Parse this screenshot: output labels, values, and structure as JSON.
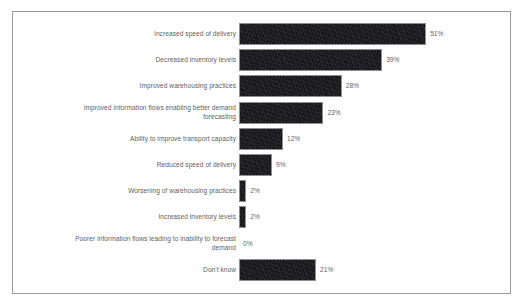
{
  "chart_data": {
    "type": "bar",
    "orientation": "horizontal",
    "title": "",
    "subtitle": "",
    "xlabel": "",
    "ylabel": "",
    "grid": false,
    "legend": null,
    "xlim": [
      0,
      51
    ],
    "value_suffix": "%",
    "categories": [
      "Increased speed of delivery",
      "Decreased inventory levels",
      "Improved warehousing practices",
      "Improved information flows enabling better demand\nforecasting",
      "Ability to improve transport capacity",
      "Reduced speed of delivery",
      "Worsening of warehousing practices",
      "Increased inventory levels",
      "Poorer information flows leading to inability to forecast\ndemand",
      "Don't know"
    ],
    "values": [
      51,
      39,
      28,
      23,
      12,
      9,
      2,
      2,
      0,
      21
    ],
    "value_labels": [
      "51%",
      "39%",
      "28%",
      "23%",
      "12%",
      "9%",
      "2%",
      "2%",
      "0%",
      "21%"
    ],
    "bar_color": "#17161a",
    "bar_border_color": "#8e8e8e",
    "label_color": "#5f5f5f",
    "value_color": "#63636a",
    "frame_border_color": "#9a9a9a",
    "background_color": "#ffffff"
  }
}
